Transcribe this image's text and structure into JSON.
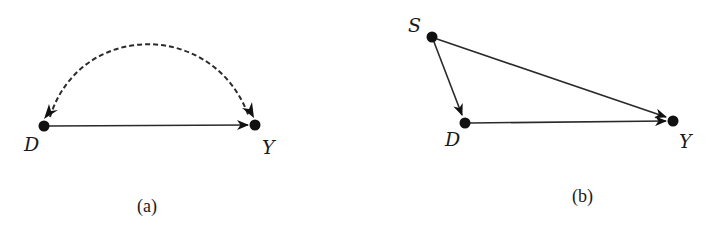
{
  "figure": {
    "panels": [
      {
        "id": "a",
        "caption": "(a)",
        "nodes": [
          {
            "id": "D",
            "label": "D",
            "x": 44,
            "y": 126
          },
          {
            "id": "Y",
            "label": "Y",
            "x": 255,
            "y": 125
          }
        ],
        "edges": [
          {
            "from": "D",
            "to": "Y",
            "style": "solid",
            "directed": true
          },
          {
            "from": "D",
            "to": "Y",
            "style": "dashed",
            "curved": true,
            "bidirected": true
          }
        ]
      },
      {
        "id": "b",
        "caption": "(b)",
        "nodes": [
          {
            "id": "S",
            "label": "S",
            "x": 432,
            "y": 37
          },
          {
            "id": "D",
            "label": "D",
            "x": 465,
            "y": 123
          },
          {
            "id": "Y",
            "label": "Y",
            "x": 673,
            "y": 121
          }
        ],
        "edges": [
          {
            "from": "S",
            "to": "D",
            "style": "solid",
            "directed": true
          },
          {
            "from": "S",
            "to": "Y",
            "style": "solid",
            "directed": true
          },
          {
            "from": "D",
            "to": "Y",
            "style": "solid",
            "directed": true
          }
        ]
      }
    ]
  },
  "labels": {
    "a_D": "D",
    "a_Y": "Y",
    "a_caption": "(a)",
    "b_S": "S",
    "b_D": "D",
    "b_Y": "Y",
    "b_caption": "(b)"
  },
  "colors": {
    "ink": "#111111",
    "background": "#ffffff"
  }
}
